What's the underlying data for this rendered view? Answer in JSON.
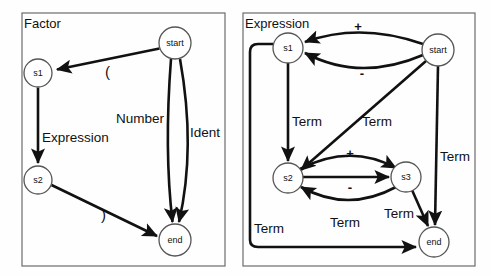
{
  "diagram": {
    "type": "state-transition-diagram",
    "panels": [
      {
        "id": "factor",
        "title": "Factor",
        "box": {
          "x": 22,
          "y": 13,
          "w": 203,
          "h": 253
        },
        "nodes": [
          {
            "id": "start",
            "label": "start",
            "cx": 175,
            "cy": 43,
            "r": 16
          },
          {
            "id": "s1",
            "label": "s1",
            "cx": 38,
            "cy": 73,
            "r": 14
          },
          {
            "id": "s2",
            "label": "s2",
            "cx": 38,
            "cy": 180,
            "r": 14
          },
          {
            "id": "end",
            "label": "end",
            "cx": 175,
            "cy": 240,
            "r": 16
          }
        ],
        "edges": [
          {
            "from": "start",
            "to": "s1",
            "label": "("
          },
          {
            "from": "s1",
            "to": "s2",
            "label": "Expression"
          },
          {
            "from": "s2",
            "to": "end",
            "label": ")"
          },
          {
            "from": "start",
            "to": "end",
            "label": "Number"
          },
          {
            "from": "start",
            "to": "end",
            "label": "Ident"
          }
        ],
        "labels": [
          {
            "text": "(",
            "x": 105,
            "y": 77
          },
          {
            "text": "Expression",
            "x": 42,
            "y": 142
          },
          {
            "text": "Number",
            "x": 116,
            "y": 123
          },
          {
            "text": "Ident",
            "x": 190,
            "y": 137
          },
          {
            "text": ")",
            "x": 101,
            "y": 220
          }
        ]
      },
      {
        "id": "expression",
        "title": "Expression",
        "box": {
          "x": 243,
          "y": 13,
          "w": 232,
          "h": 253
        },
        "nodes": [
          {
            "id": "s1",
            "label": "s1",
            "cx": 288,
            "cy": 48,
            "r": 15
          },
          {
            "id": "start",
            "label": "start",
            "cx": 438,
            "cy": 50,
            "r": 16
          },
          {
            "id": "s2",
            "label": "s2",
            "cx": 288,
            "cy": 178,
            "r": 15
          },
          {
            "id": "s3",
            "label": "s3",
            "cx": 406,
            "cy": 177,
            "r": 15
          },
          {
            "id": "end",
            "label": "end",
            "cx": 434,
            "cy": 242,
            "r": 15
          }
        ],
        "edges": [
          {
            "from": "start",
            "to": "s1",
            "label": "+"
          },
          {
            "from": "start",
            "to": "s1",
            "label": "-"
          },
          {
            "from": "s1",
            "to": "s2",
            "label": "Term"
          },
          {
            "from": "start",
            "to": "s2",
            "label": "Term"
          },
          {
            "from": "start",
            "to": "end",
            "label": "Term"
          },
          {
            "from": "s2",
            "to": "s3",
            "label": "+"
          },
          {
            "from": "s3",
            "to": "s2",
            "label": "-"
          },
          {
            "from": "s3",
            "to": "s2",
            "label": "Term"
          },
          {
            "from": "s3",
            "to": "end",
            "label": "Term"
          },
          {
            "from": "s1",
            "to": "end",
            "label": "Term"
          }
        ],
        "labels": [
          {
            "text": "+",
            "x": 358,
            "y": 31
          },
          {
            "text": "-",
            "x": 362,
            "y": 76
          },
          {
            "text": "Term",
            "x": 292,
            "y": 121
          },
          {
            "text": "Term",
            "x": 362,
            "y": 121
          },
          {
            "text": "Term",
            "x": 440,
            "y": 156
          },
          {
            "text": "+",
            "x": 350,
            "y": 155
          },
          {
            "text": "-",
            "x": 350,
            "y": 189
          },
          {
            "text": "Term",
            "x": 330,
            "y": 222
          },
          {
            "text": "Term",
            "x": 384,
            "y": 213
          },
          {
            "text": "Term",
            "x": 254,
            "y": 228
          }
        ]
      }
    ],
    "colors": {
      "stroke": "#111111",
      "panel_border": "#6b6b6b",
      "node_fill": "#ffffff",
      "background": "#fefefe"
    }
  }
}
